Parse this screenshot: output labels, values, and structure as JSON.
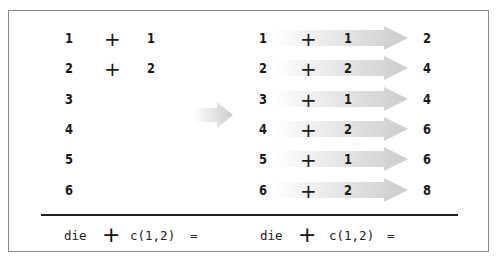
{
  "left_panel": {
    "rows": [
      {
        "a": "1",
        "op": "+",
        "b": "1"
      },
      {
        "a": "2",
        "op": "+",
        "b": "2"
      },
      {
        "a": "3",
        "op": "",
        "b": ""
      },
      {
        "a": "4",
        "op": "",
        "b": ""
      },
      {
        "a": "5",
        "op": "",
        "b": ""
      },
      {
        "a": "6",
        "op": "",
        "b": ""
      }
    ],
    "caption": {
      "left": "die",
      "op": "+",
      "right": "c(1,2)",
      "eq": "="
    }
  },
  "right_panel": {
    "rows": [
      {
        "a": "1",
        "op": "+",
        "b": "1",
        "result": "2"
      },
      {
        "a": "2",
        "op": "+",
        "b": "2",
        "result": "4"
      },
      {
        "a": "3",
        "op": "+",
        "b": "1",
        "result": "4"
      },
      {
        "a": "4",
        "op": "+",
        "b": "2",
        "result": "6"
      },
      {
        "a": "5",
        "op": "+",
        "b": "1",
        "result": "6"
      },
      {
        "a": "6",
        "op": "+",
        "b": "2",
        "result": "8"
      }
    ],
    "caption": {
      "left": "die",
      "op": "+",
      "right": "c(1,2)",
      "eq": "="
    }
  },
  "colors": {
    "arrow_light": "#f4f4f4",
    "arrow_dark": "#cfcfcf",
    "border": "#8a8a8a",
    "text": "#1a1a1a"
  }
}
